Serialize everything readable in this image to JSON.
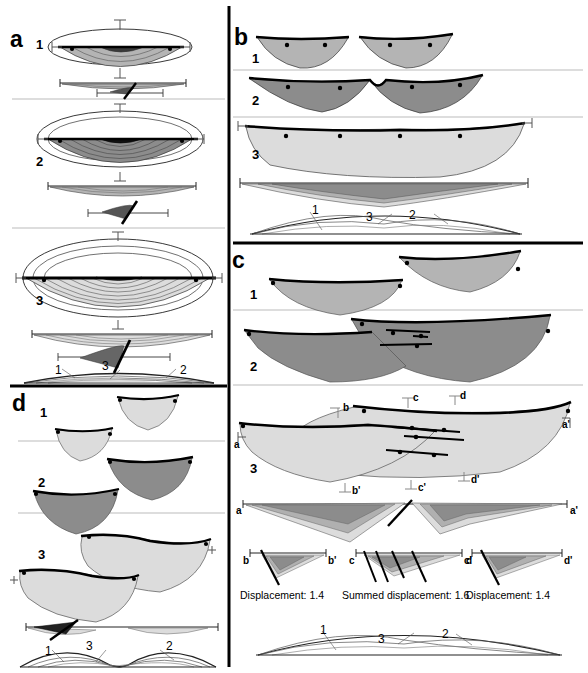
{
  "figure": {
    "background_color": "#ffffff",
    "panels": [
      {
        "id": "a",
        "label": "a",
        "stages": [
          "1",
          "2",
          "3"
        ]
      },
      {
        "id": "b",
        "label": "b",
        "stages": [
          "1",
          "2",
          "3"
        ]
      },
      {
        "id": "c",
        "label": "c",
        "stages": [
          "1",
          "2",
          "3"
        ]
      },
      {
        "id": "d",
        "label": "d",
        "stages": [
          "1",
          "2",
          "3"
        ]
      }
    ]
  },
  "colors": {
    "stage1_fill": "#b4b4b4",
    "stage2_fill": "#8c8c8c",
    "stage3_fill": "#dcdcdc",
    "line": "#000000",
    "thin_line": "#444444",
    "divider": "#b9b9b9",
    "heavy_divider": "#000000"
  },
  "panel_a": {
    "letter": "a",
    "stage_labels": [
      "1",
      "2",
      "3"
    ],
    "contour_counts": [
      3,
      6,
      8
    ],
    "profile_numbers": [
      "1",
      "3",
      "2"
    ]
  },
  "panel_b": {
    "letter": "b",
    "stage_labels": [
      "1",
      "2",
      "3"
    ],
    "stage1_segments": 2,
    "stage2_segments": 2,
    "stage3_segments": 1,
    "profile_numbers": [
      "1",
      "3",
      "2"
    ]
  },
  "panel_c": {
    "letter": "c",
    "stage_labels": [
      "1",
      "2",
      "3"
    ],
    "section_labels": {
      "a": "a",
      "a_prime": "a'",
      "b": "b",
      "b_prime": "b'",
      "c": "c",
      "c_prime": "c'",
      "d": "d",
      "d_prime": "d'"
    },
    "cross_sections": [
      {
        "left_label": "b",
        "right_label": "b'",
        "caption": "Displacement: 1.4"
      },
      {
        "left_label": "c",
        "right_label": "c'",
        "caption": "Summed displacement: 1.6"
      },
      {
        "left_label": "d",
        "right_label": "d'",
        "caption": "Displacement: 1.4"
      }
    ],
    "aa_section": {
      "left_label": "a",
      "right_label": "a'"
    },
    "profile_numbers": [
      "1",
      "3",
      "2"
    ]
  },
  "panel_d": {
    "letter": "d",
    "stage_labels": [
      "1",
      "2",
      "3"
    ],
    "profile_numbers": [
      "1",
      "3",
      "2"
    ]
  }
}
